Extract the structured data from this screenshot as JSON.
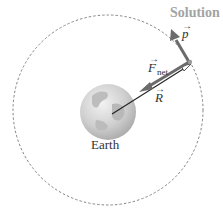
{
  "title": "Solution",
  "earth": {
    "label": "Earth"
  },
  "vectors": {
    "momentum": {
      "symbol": "p",
      "arrow": "→"
    },
    "net_force": {
      "symbol": "F",
      "subscript": "net",
      "arrow": "→"
    },
    "position": {
      "symbol": "R",
      "arrow": "→"
    }
  },
  "colors": {
    "title": "#a3a3a3",
    "vector": "#6b6b6b",
    "orbit": "#777777",
    "text": "#333333"
  }
}
